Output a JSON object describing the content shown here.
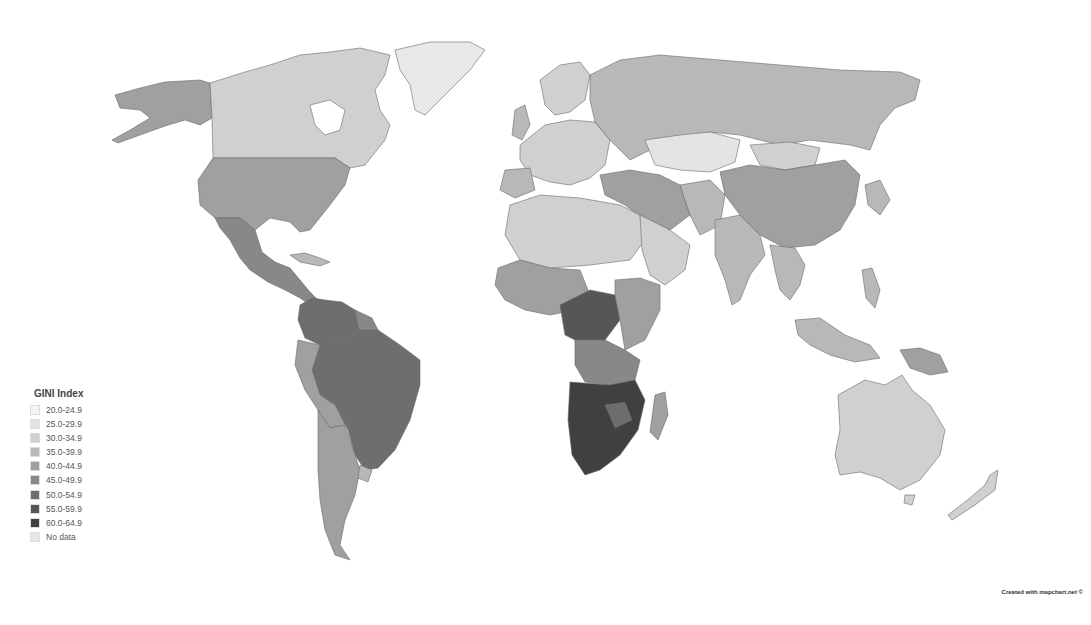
{
  "map": {
    "title": "GINI Index world choropleth",
    "projection": "Robinson-like world map",
    "ocean_color": "#ffffff",
    "border_color": "#6a6a6a"
  },
  "legend": {
    "title": "GINI Index",
    "items": [
      {
        "label": "20.0-24.9",
        "color": "#f4f4f4"
      },
      {
        "label": "25.0-29.9",
        "color": "#e4e4e4"
      },
      {
        "label": "30.0-34.9",
        "color": "#d0d0d0"
      },
      {
        "label": "35.0-39.9",
        "color": "#b8b8b8"
      },
      {
        "label": "40.0-44.9",
        "color": "#a0a0a0"
      },
      {
        "label": "45.0-49.9",
        "color": "#888888"
      },
      {
        "label": "50.0-54.9",
        "color": "#6e6e6e"
      },
      {
        "label": "55.0-59.9",
        "color": "#565656"
      },
      {
        "label": "60.0-64.9",
        "color": "#404040"
      },
      {
        "label": "No data",
        "color": "#e8e8e8"
      }
    ]
  },
  "regions": [
    {
      "name": "Canada",
      "class": "30.0-34.9"
    },
    {
      "name": "Alaska (USA)",
      "class": "40.0-44.9"
    },
    {
      "name": "United States",
      "class": "40.0-44.9"
    },
    {
      "name": "Greenland",
      "class": "No data"
    },
    {
      "name": "Mexico & Central America",
      "class": "45.0-49.9"
    },
    {
      "name": "Colombia / Venezuela",
      "class": "50.0-54.9"
    },
    {
      "name": "Brazil",
      "class": "50.0-54.9"
    },
    {
      "name": "Peru / Bolivia",
      "class": "40.0-44.9"
    },
    {
      "name": "Argentina / Chile",
      "class": "40.0-44.9"
    },
    {
      "name": "Uruguay",
      "class": "35.0-39.9"
    },
    {
      "name": "Europe",
      "class": "30.0-34.9"
    },
    {
      "name": "Russia",
      "class": "35.0-39.9"
    },
    {
      "name": "Kazakhstan",
      "class": "25.0-29.9"
    },
    {
      "name": "Mongolia",
      "class": "30.0-34.9"
    },
    {
      "name": "China",
      "class": "40.0-44.9"
    },
    {
      "name": "Turkey / Iran",
      "class": "40.0-44.9"
    },
    {
      "name": "India",
      "class": "35.0-39.9"
    },
    {
      "name": "Southeast Asia",
      "class": "35.0-39.9"
    },
    {
      "name": "North Africa / Middle East",
      "class": "30.0-34.9"
    },
    {
      "name": "West Africa",
      "class": "40.0-44.9"
    },
    {
      "name": "Central Africa",
      "class": "55.0-59.9"
    },
    {
      "name": "East Africa",
      "class": "40.0-44.9"
    },
    {
      "name": "Southern Africa",
      "class": "60.0-64.9"
    },
    {
      "name": "Madagascar",
      "class": "40.0-44.9"
    },
    {
      "name": "Australia",
      "class": "30.0-34.9"
    },
    {
      "name": "New Zealand",
      "class": "30.0-34.9"
    },
    {
      "name": "Papua New Guinea",
      "class": "40.0-44.9"
    }
  ],
  "credit": "Created with mapchart.net ©"
}
